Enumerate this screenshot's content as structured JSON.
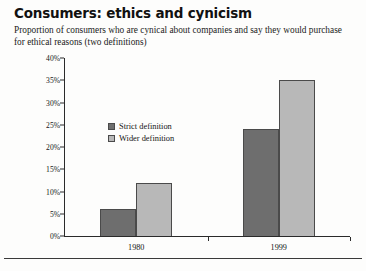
{
  "figure": {
    "title": "Consumers: ethics and cynicism",
    "subtitle": "Proportion of consumers who are cynical about companies and say they would purchase for ethical reasons (two definitions)"
  },
  "legend": {
    "position": "inside-top-left",
    "items": [
      {
        "label": "Strict definition",
        "color": "#6e6e6e",
        "swatch_icon": "square-swatch-icon"
      },
      {
        "label": "Wider definition",
        "color": "#b8b8b8",
        "swatch_icon": "square-swatch-icon"
      }
    ]
  },
  "axes": {
    "y_ticks": [
      "0%",
      "5%",
      "10%",
      "15%",
      "20%",
      "25%",
      "30%",
      "35%",
      "40%"
    ],
    "x_ticks": [
      "1980",
      "1999"
    ]
  },
  "chart_data": {
    "type": "bar",
    "title": "Consumers: ethics and cynicism",
    "subtitle": "Proportion of consumers who are cynical about companies and say they would purchase for ethical reasons (two definitions)",
    "categories": [
      "1980",
      "1999"
    ],
    "series": [
      {
        "name": "Strict definition",
        "color": "#6e6e6e",
        "values": [
          6,
          24
        ]
      },
      {
        "name": "Wider definition",
        "color": "#b8b8b8",
        "values": [
          12,
          35
        ]
      }
    ],
    "bars": [
      {
        "category": "1980",
        "series": "Strict definition",
        "value": 6
      },
      {
        "category": "1980",
        "series": "Wider definition",
        "value": 24
      },
      {
        "category": "1999",
        "series": "Strict definition",
        "value": 12
      },
      {
        "category": "1999",
        "series": "Wider definition",
        "value": 35
      }
    ],
    "xlabel": "",
    "ylabel": "",
    "ylim": [
      0,
      40
    ],
    "ytick_step": 5,
    "ytick_format": "percent",
    "grid": false,
    "legend": [
      "Strict definition",
      "Wider definition"
    ]
  }
}
